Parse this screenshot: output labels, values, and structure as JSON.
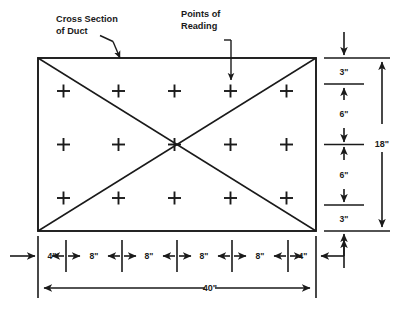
{
  "diagram": {
    "title_labels": {
      "cross_section": {
        "line1": "Cross Section",
        "line2": "of Duct"
      },
      "points_of_reading": {
        "line1": "Points of",
        "line2": "Reading"
      }
    },
    "duct": {
      "shape": "rectangle",
      "width_label": "40\"",
      "height_label": "18\""
    },
    "horizontal_dimensions": [
      {
        "label": "4\""
      },
      {
        "label": "8\""
      },
      {
        "label": "8\""
      },
      {
        "label": "8\""
      },
      {
        "label": "8\""
      },
      {
        "label": "4\""
      }
    ],
    "vertical_dimensions": [
      {
        "label": "3\""
      },
      {
        "label": "6\""
      },
      {
        "label": "6\""
      },
      {
        "label": "3\""
      }
    ],
    "overall_width": "40\"",
    "overall_height": "18\"",
    "reading_points": {
      "rows": 3,
      "columns": 5,
      "count": 15,
      "marker": "plus-mark"
    },
    "colors": {
      "ink": "#1a1a1a",
      "background": "#ffffff"
    }
  }
}
